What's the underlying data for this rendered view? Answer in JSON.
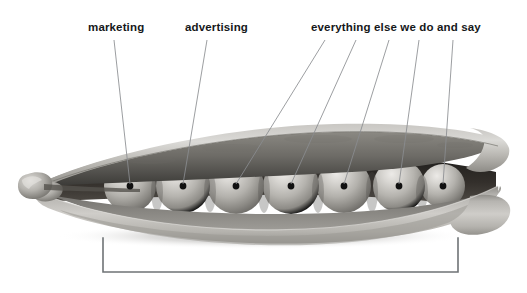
{
  "figure": {
    "kind": "annotated-illustration",
    "background_color": "#ffffff",
    "palette": {
      "text": "#16181a",
      "leader_line": "#8a8d90",
      "bracket": "#6f7376",
      "pod_light": "#d8d7d4",
      "pod_mid": "#b0aeaa",
      "pod_dark": "#8e8c88",
      "pod_interior_shadow": "#2b2a28",
      "pea_highlight": "#e2e1de",
      "pea_mid": "#b9b7b3",
      "pea_shadow": "#6e6c69",
      "dot": "#111111",
      "ground_shadow": "#c9c8c6"
    }
  },
  "labels": [
    {
      "id": "marketing",
      "text": "marketing",
      "x": 88,
      "y": 22
    },
    {
      "id": "advertising",
      "text": "advertising",
      "x": 185,
      "y": 22
    },
    {
      "id": "everything",
      "text": "everything else we do and say",
      "x": 311,
      "y": 22
    }
  ],
  "leader_lines": [
    {
      "id": "line-1",
      "label": "marketing",
      "x1": 114,
      "y1": 40,
      "x2": 130,
      "y2": 184
    },
    {
      "id": "line-2",
      "label": "advertising",
      "x1": 207,
      "y1": 40,
      "x2": 183,
      "y2": 184
    },
    {
      "id": "line-3",
      "label": "everything",
      "x1": 325,
      "y1": 40,
      "x2": 236,
      "y2": 184
    },
    {
      "id": "line-4",
      "label": "everything",
      "x1": 356,
      "y1": 40,
      "x2": 291,
      "y2": 184
    },
    {
      "id": "line-5",
      "label": "everything",
      "x1": 389,
      "y1": 40,
      "x2": 344,
      "y2": 184
    },
    {
      "id": "line-6",
      "label": "everything",
      "x1": 419,
      "y1": 40,
      "x2": 399,
      "y2": 184
    },
    {
      "id": "line-7",
      "label": "everything",
      "x1": 453,
      "y1": 40,
      "x2": 443,
      "y2": 184
    }
  ],
  "peas": [
    {
      "id": "pea-1",
      "cx": 130,
      "cy": 186,
      "r": 26
    },
    {
      "id": "pea-2",
      "cx": 183,
      "cy": 186,
      "r": 27
    },
    {
      "id": "pea-3",
      "cx": 236,
      "cy": 186,
      "r": 28
    },
    {
      "id": "pea-4",
      "cx": 291,
      "cy": 186,
      "r": 28
    },
    {
      "id": "pea-5",
      "cx": 344,
      "cy": 186,
      "r": 27
    },
    {
      "id": "pea-6",
      "cx": 399,
      "cy": 186,
      "r": 26
    },
    {
      "id": "pea-7",
      "cx": 443,
      "cy": 186,
      "r": 22
    }
  ],
  "dots": [
    {
      "id": "dot-1",
      "cx": 130,
      "cy": 186,
      "r": 3.4
    },
    {
      "id": "dot-2",
      "cx": 183,
      "cy": 186,
      "r": 3.4
    },
    {
      "id": "dot-3",
      "cx": 236,
      "cy": 186,
      "r": 3.4
    },
    {
      "id": "dot-4",
      "cx": 291,
      "cy": 186,
      "r": 3.4
    },
    {
      "id": "dot-5",
      "cx": 344,
      "cy": 186,
      "r": 3.4
    },
    {
      "id": "dot-6",
      "cx": 399,
      "cy": 186,
      "r": 3.4
    },
    {
      "id": "dot-7",
      "cx": 443,
      "cy": 186,
      "r": 3.4
    }
  ],
  "bracket": {
    "id": "bottom-bracket",
    "left_x": 103,
    "right_x": 458,
    "top_y": 238,
    "bottom_y": 272,
    "stroke": "#6f7376",
    "stroke_width": 1.6,
    "caption": ""
  },
  "counts": {
    "peas": 7,
    "leader_lines": 7,
    "labels": 3
  }
}
